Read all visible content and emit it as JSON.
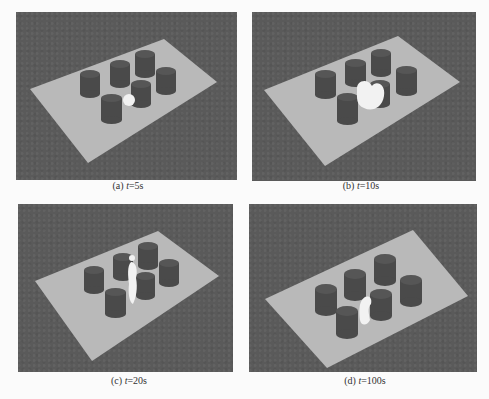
{
  "figure": {
    "panels": [
      {
        "id": "a",
        "label": "(a)",
        "var": "t",
        "value": "=5s"
      },
      {
        "id": "b",
        "label": "(b)",
        "var": "t",
        "value": "=10s"
      },
      {
        "id": "c",
        "label": "(c)",
        "var": "t",
        "value": "=20s"
      },
      {
        "id": "d",
        "label": "(d)",
        "var": "t",
        "value": "=100s"
      }
    ]
  },
  "colors": {
    "background": "#5a5a5a",
    "plate": "#b9b9b9",
    "cylinder": "#4a4a4a",
    "cylinder_top": "#555555",
    "fluid": "#f2f2f2"
  }
}
